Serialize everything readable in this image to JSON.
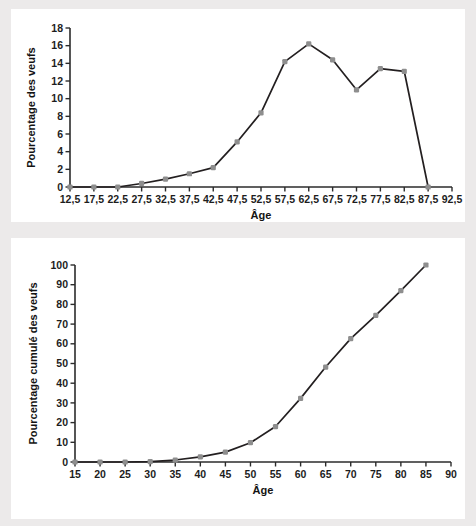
{
  "figure": {
    "background_color": "#eceaea",
    "panel_color": "#ffffff",
    "line_color": "#231f20",
    "marker_color": "#8e8e8e",
    "axis_color": "#2b2b2b"
  },
  "chart_data": [
    {
      "id": "distribution",
      "type": "line",
      "title": "",
      "xlabel": "Âge",
      "ylabel": "Pourcentage des veufs",
      "xlim": [
        12.5,
        92.5
      ],
      "ylim": [
        0,
        18
      ],
      "grid": false,
      "legend": "none",
      "xticklabels": [
        "12,5",
        "17,5",
        "22,5",
        "27,5",
        "32,5",
        "37,5",
        "42,5",
        "47,5",
        "52,5",
        "57,5",
        "62,5",
        "67,5",
        "72,5",
        "77,5",
        "82,5",
        "87,5",
        "92,5"
      ],
      "yticklabels": [
        "0",
        "2",
        "4",
        "6",
        "8",
        "10",
        "12",
        "14",
        "16",
        "18"
      ],
      "xticks": [
        12.5,
        17.5,
        22.5,
        27.5,
        32.5,
        37.5,
        42.5,
        47.5,
        52.5,
        57.5,
        62.5,
        67.5,
        72.5,
        77.5,
        82.5,
        87.5,
        92.5
      ],
      "yticks": [
        0,
        2,
        4,
        6,
        8,
        10,
        12,
        14,
        16,
        18
      ],
      "x": [
        12.5,
        17.5,
        22.5,
        27.5,
        32.5,
        37.5,
        42.5,
        47.5,
        52.5,
        57.5,
        62.5,
        67.5,
        72.5,
        77.5,
        82.5,
        87.5
      ],
      "values": [
        0.0,
        0.0,
        0.0,
        0.4,
        0.9,
        1.5,
        2.2,
        5.1,
        8.4,
        14.2,
        16.2,
        14.4,
        11.0,
        13.4,
        13.1,
        0.0
      ]
    },
    {
      "id": "cumulative",
      "type": "line",
      "title": "",
      "xlabel": "Âge",
      "ylabel": "Pourcentage cumulé des veufs",
      "xlim": [
        15,
        90
      ],
      "ylim": [
        0,
        100
      ],
      "grid": false,
      "legend": "none",
      "xticklabels": [
        "15",
        "20",
        "25",
        "30",
        "35",
        "40",
        "45",
        "50",
        "55",
        "60",
        "65",
        "70",
        "75",
        "80",
        "85",
        "90"
      ],
      "yticklabels": [
        "0",
        "10",
        "20",
        "30",
        "40",
        "50",
        "60",
        "70",
        "80",
        "90",
        "100"
      ],
      "xticks": [
        15,
        20,
        25,
        30,
        35,
        40,
        45,
        50,
        55,
        60,
        65,
        70,
        75,
        80,
        85,
        90
      ],
      "yticks": [
        0,
        10,
        20,
        30,
        40,
        50,
        60,
        70,
        80,
        90,
        100
      ],
      "x": [
        15,
        20,
        25,
        30,
        35,
        40,
        45,
        50,
        55,
        60,
        65,
        70,
        75,
        80,
        85
      ],
      "values": [
        0.0,
        0.0,
        0.0,
        0.2,
        1.0,
        2.6,
        5.0,
        9.8,
        18.0,
        32.3,
        48.2,
        62.6,
        74.4,
        87.0,
        100.0
      ]
    }
  ]
}
